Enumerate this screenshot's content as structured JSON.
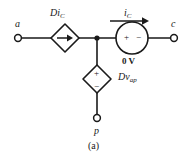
{
  "figure": {
    "caption": "(a)",
    "type": "circuit-diagram"
  },
  "terminals": [
    {
      "name": "a",
      "label": "a",
      "position": "left"
    },
    {
      "name": "c",
      "label": "c",
      "position": "right"
    },
    {
      "name": "p",
      "label": "p",
      "position": "bottom"
    }
  ],
  "elements": [
    {
      "name": "dependent-current-source",
      "symbol": "diamond-arrow-right",
      "label_main": "Di",
      "label_sub": "C",
      "label_full": "DiC"
    },
    {
      "name": "zero-volt-source",
      "symbol": "circle-plus-minus",
      "polarity_left": "+",
      "polarity_right": "−",
      "value_label": "0 V"
    },
    {
      "name": "dependent-voltage-source",
      "symbol": "diamond-plus-minus",
      "polarity_top": "+",
      "polarity_bottom": "−",
      "label_main": "Dv",
      "label_sub": "ap",
      "label_full": "Dvap"
    }
  ],
  "annotations": [
    {
      "name": "current-label",
      "label_main": "i",
      "label_sub": "C",
      "label_full": "iC",
      "arrow_direction": "right"
    }
  ],
  "colors": {
    "wire": "#1a1a1a",
    "text": "#1a1a1a",
    "background": "#ffffff"
  }
}
